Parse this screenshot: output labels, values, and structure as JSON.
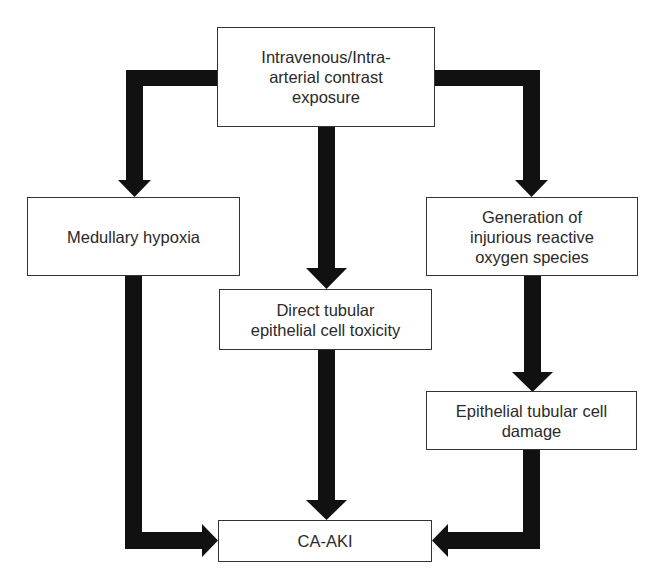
{
  "diagram": {
    "type": "flowchart",
    "colors": {
      "arrow": "#111111",
      "box_border": "#333333",
      "text": "#2a2a2a",
      "background": "#ffffff"
    },
    "nodes": {
      "exposure": {
        "label": "Intravenous/Intra-\narterial contrast\nexposure"
      },
      "hypoxia": {
        "label": "Medullary hypoxia"
      },
      "ros": {
        "label": "Generation of\ninjurious reactive\noxygen species"
      },
      "toxicity": {
        "label": "Direct tubular\nepithelial cell toxicity"
      },
      "damage": {
        "label": "Epithelial tubular cell\ndamage"
      },
      "outcome": {
        "label": "CA-AKI"
      }
    },
    "edges": [
      {
        "from": "exposure",
        "to": "hypoxia"
      },
      {
        "from": "exposure",
        "to": "toxicity"
      },
      {
        "from": "exposure",
        "to": "ros"
      },
      {
        "from": "ros",
        "to": "damage"
      },
      {
        "from": "hypoxia",
        "to": "outcome"
      },
      {
        "from": "toxicity",
        "to": "outcome"
      },
      {
        "from": "damage",
        "to": "outcome"
      }
    ]
  }
}
